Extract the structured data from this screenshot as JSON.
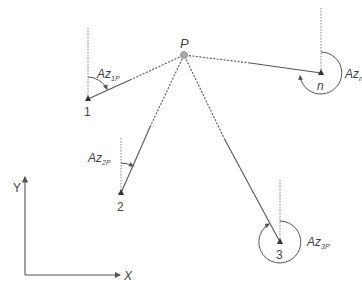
{
  "diagram": {
    "unknown_point": {
      "label": "P",
      "x": 184,
      "y": 55
    },
    "stations": [
      {
        "id": "1",
        "label": "1",
        "x": 88,
        "y": 99,
        "az_label": "Az",
        "az_sub": "1P"
      },
      {
        "id": "2",
        "label": "2",
        "x": 121,
        "y": 193,
        "az_label": "Az",
        "az_sub": "2P"
      },
      {
        "id": "3",
        "label": "3",
        "x": 280,
        "y": 242,
        "az_label": "Az",
        "az_sub": "3P"
      },
      {
        "id": "n",
        "label": "n",
        "x": 321,
        "y": 73,
        "az_label": "Az",
        "az_sub": "n"
      }
    ],
    "axes": {
      "x_label": "X",
      "y_label": "Y"
    },
    "colors": {
      "line": "#555555",
      "point": "#999999",
      "marker": "#333333",
      "text": "#444444"
    }
  }
}
